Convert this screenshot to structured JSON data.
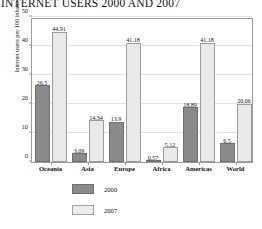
{
  "chart_data": {
    "type": "bar",
    "title": "INTERNET USERS 2000 AND 2007",
    "xlabel": "",
    "ylabel": "Internet users per 100 inhabitants",
    "categories": [
      "Oceania",
      "Asia",
      "Europe",
      "Africa",
      "Americas",
      "World"
    ],
    "series": [
      {
        "name": "2000",
        "color": "#8a8a8a",
        "values": [
          26.5,
          3.09,
          13.9,
          0.57,
          18.89,
          6.5
        ],
        "labels": [
          "26.5",
          "3.09",
          "13.9",
          "0.57",
          "18.89",
          "6.5"
        ]
      },
      {
        "name": "2007",
        "color": "#e9e9e9",
        "values": [
          44.91,
          14.34,
          41.18,
          5.12,
          41.18,
          20.06
        ],
        "labels": [
          "44.91",
          "14.34",
          "41.18",
          "5.12",
          "41.18",
          "20.06"
        ]
      }
    ],
    "ylim": [
      0,
      50
    ],
    "yticks": [
      0,
      10,
      20,
      30,
      40,
      50
    ],
    "ytick_labels": [
      "0",
      "10",
      "20",
      "30",
      "40",
      "50"
    ],
    "grid": true,
    "legend_position": "below-center"
  },
  "legend": {
    "entries": [
      {
        "label": "2000"
      },
      {
        "label": "2007"
      }
    ]
  }
}
